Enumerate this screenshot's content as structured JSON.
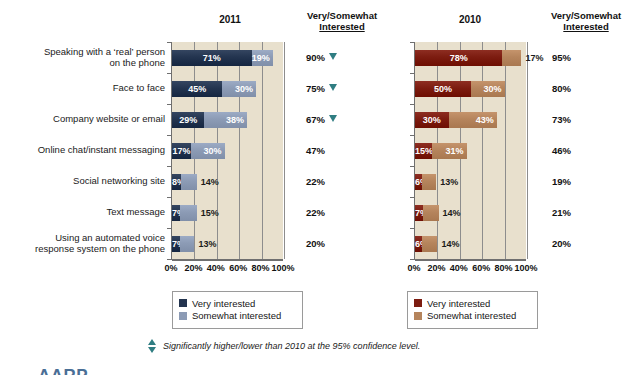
{
  "headers": {
    "left_total_line1": "Very/Somewhat",
    "left_total_line2": "Interested",
    "right_total_line1": "Very/Somewhat",
    "right_total_line2": "Interested",
    "year_left": "2011",
    "year_right": "2010"
  },
  "legend_left": {
    "very_label": "Very interested",
    "somewhat_label": "Somewhat interested",
    "very_color": "#23344f",
    "somewhat_color": "#8c9bb5"
  },
  "legend_right": {
    "very_label": "Very interested",
    "somewhat_label": "Somewhat interested",
    "very_color": "#7c1c10",
    "somewhat_color": "#b5845c"
  },
  "footnote": {
    "text": "Significantly higher/lower than 2010 at the 95% confidence level.",
    "marker_color": "#2f7d82"
  },
  "cropped_logo": "AARP",
  "chart_data": {
    "type": "bar",
    "orientation": "horizontal",
    "stacked": true,
    "xlabel": "",
    "ylabel": "",
    "xlim": [
      0,
      100
    ],
    "grid": true,
    "legend_position": "below-plot",
    "tick_labels": [
      "0%",
      "20%",
      "40%",
      "60%",
      "80%",
      "100%"
    ],
    "tick_values": [
      0,
      20,
      40,
      60,
      80,
      100
    ],
    "categories": [
      "Speaking with a ‘real’ person on the phone",
      "Face to face",
      "Company website or email",
      "Online chat/instant messaging",
      "Social networking site",
      "Text message",
      "Using an automated voice response system on the phone"
    ],
    "category_lines": [
      [
        "Speaking with a ‘real’ person",
        "on the phone"
      ],
      [
        "Face to face"
      ],
      [
        "Company website or email"
      ],
      [
        "Online chat/instant messaging"
      ],
      [
        "Social networking site"
      ],
      [
        "Text message"
      ],
      [
        "Using an automated voice",
        "response system on the phone"
      ]
    ],
    "panels": [
      {
        "name": "2011",
        "year": "2011",
        "very_color": "#23344f",
        "somewhat_color": "#8c9bb5",
        "series": [
          {
            "name": "Very interested",
            "values": [
              71,
              45,
              29,
              17,
              8,
              7,
              7
            ]
          },
          {
            "name": "Somewhat interested",
            "values": [
              19,
              30,
              38,
              30,
              14,
              15,
              13
            ]
          }
        ],
        "very_labels": [
          "71%",
          "45%",
          "29%",
          "17%",
          "8%",
          "7%",
          "7%"
        ],
        "somewhat_labels": [
          "19%",
          "30%",
          "38%",
          "30%",
          "14%",
          "15%",
          "13%"
        ],
        "totals": [
          "90%",
          "75%",
          "67%",
          "47%",
          "22%",
          "22%",
          "20%"
        ],
        "total_values": [
          90,
          75,
          67,
          47,
          22,
          22,
          20
        ],
        "significance": [
          "lower",
          "lower",
          "lower",
          "none",
          "none",
          "none",
          "none"
        ]
      },
      {
        "name": "2010",
        "year": "2010",
        "very_color": "#7c1c10",
        "somewhat_color": "#b5845c",
        "series": [
          {
            "name": "Very interested",
            "values": [
              78,
              50,
              30,
              15,
              6,
              7,
              6
            ]
          },
          {
            "name": "Somewhat interested",
            "values": [
              17,
              30,
              43,
              31,
              13,
              14,
              14
            ]
          }
        ],
        "very_labels": [
          "78%",
          "50%",
          "30%",
          "15%",
          "6%",
          "7%",
          "6%"
        ],
        "somewhat_labels": [
          "17%",
          "30%",
          "43%",
          "31%",
          "13%",
          "14%",
          "14%"
        ],
        "totals": [
          "95%",
          "80%",
          "73%",
          "46%",
          "19%",
          "21%",
          "20%"
        ],
        "total_values": [
          95,
          80,
          73,
          46,
          19,
          21,
          20
        ],
        "significance": [
          "none",
          "none",
          "none",
          "none",
          "none",
          "none",
          "none"
        ]
      }
    ]
  }
}
